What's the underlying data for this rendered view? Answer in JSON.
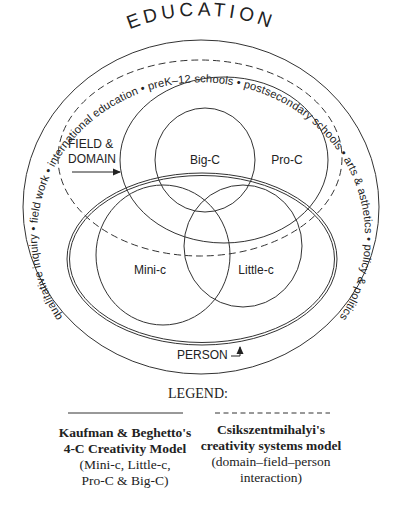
{
  "diagram": {
    "title": "EDUCATION",
    "ring_text": "qualitative inquiry • field work • international education • preK–12 schools • postsecondary schools • arts & asthetics • policy & politics",
    "ring_items": [
      "qualitative inquiry",
      "field work",
      "international education",
      "preK–12 schools",
      "postsecondary schools",
      "arts & asthetics",
      "policy & politics"
    ],
    "field_domain_label_line1": "FIELD &",
    "field_domain_label_line2": "DOMAIN",
    "person_label": "PERSON",
    "circles": {
      "big_c": "Big-C",
      "pro_c": "Pro-C",
      "mini_c": "Mini-c",
      "little_c": "Little-c"
    }
  },
  "legend": {
    "title": "LEGEND:",
    "solid": {
      "line_style": "solid",
      "line1": "Kaufman & Beghetto's",
      "line2": "4-C Creativity Model",
      "line3": "(Mini-c, Little-c,",
      "line4": "Pro-C & Big-C)"
    },
    "dashed": {
      "line_style": "dashed",
      "line1": "Csikszentmihalyi's",
      "line2": "creativity systems model",
      "line3": "(domain–field–person",
      "line4": "interaction)"
    }
  },
  "colors": {
    "ink": "#222222",
    "background": "#ffffff"
  }
}
